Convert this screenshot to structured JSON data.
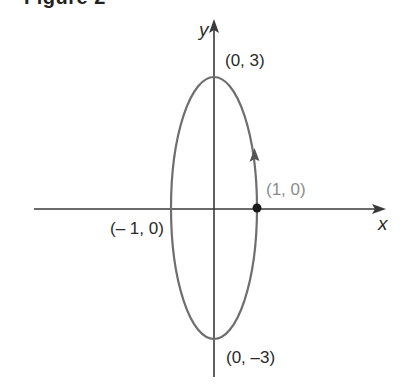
{
  "heading": {
    "text": "Figure 2"
  },
  "axes": {
    "x_label": "x",
    "y_label": "y"
  },
  "points": {
    "top": "(0, 3)",
    "bottom": "(0, –3)",
    "left": "(– 1, 0)",
    "right": "(1, 0)"
  },
  "curve": {
    "type": "ellipse",
    "center": [
      0,
      0
    ],
    "semi_axis_x": 1,
    "semi_axis_y": 3,
    "start_point": "(1, 0)",
    "direction": "counterclockwise"
  },
  "colors": {
    "curve": "#6e6e6e",
    "axes": "#3a3a3a",
    "text": "#2a2a2a",
    "start_label": "#8c8c8c",
    "point": "#1a1a1a"
  }
}
